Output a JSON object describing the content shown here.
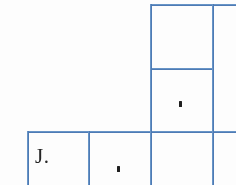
{
  "document": {
    "type": "scanned-table-fragment",
    "background_color": "#ffffff",
    "rule_color": "#4a7ebb",
    "text_color": "#262626"
  },
  "table": {
    "rows": [
      {
        "name": "top-row",
        "cells": [
          {
            "name": "top-left-blank",
            "text": ""
          },
          {
            "name": "top-right-upper",
            "text": ""
          }
        ]
      },
      {
        "name": "middle-row",
        "cells": [
          {
            "name": "middle-left-blank",
            "text": ""
          },
          {
            "name": "middle-right",
            "text": "."
          }
        ]
      },
      {
        "name": "bottom-row",
        "cells": [
          {
            "name": "bottom-initial",
            "text": "J."
          },
          {
            "name": "bottom-middle",
            "text": "."
          },
          {
            "name": "bottom-right",
            "text": ""
          }
        ]
      }
    ]
  },
  "content": {
    "initial_label": "J.",
    "middle_right_mark": ".",
    "bottom_middle_mark": "."
  },
  "rules": {
    "horizontal": [
      {
        "name": "rule-top-full",
        "x": 150,
        "y": 4,
        "width": 86
      },
      {
        "name": "rule-mid-right",
        "x": 150,
        "y": 68,
        "width": 63
      },
      {
        "name": "rule-bottom-band",
        "x": 27,
        "y": 131,
        "width": 209
      }
    ],
    "vertical": [
      {
        "name": "rule-col-left",
        "x": 27,
        "y": 131,
        "height": 54
      },
      {
        "name": "rule-col-inner-left",
        "x": 88,
        "y": 131,
        "height": 54
      },
      {
        "name": "rule-col-center",
        "x": 150,
        "y": 4,
        "height": 181
      },
      {
        "name": "rule-col-right",
        "x": 212,
        "y": 4,
        "height": 181
      }
    ]
  }
}
